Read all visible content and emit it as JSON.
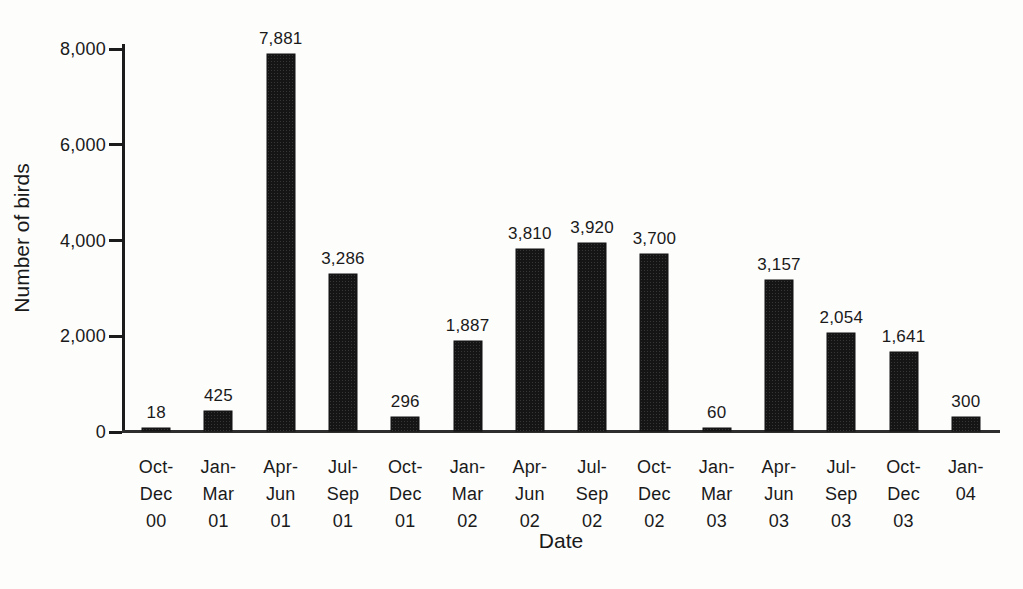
{
  "chart_data": {
    "type": "bar",
    "title": "",
    "xlabel": "Date",
    "ylabel": "Number of birds",
    "ylim": [
      0,
      8000
    ],
    "grid": false,
    "legend": "none",
    "bar_color": "#151515",
    "y_ticks": [
      {
        "value": 0,
        "label": "0"
      },
      {
        "value": 2000,
        "label": "2,000"
      },
      {
        "value": 4000,
        "label": "4,000"
      },
      {
        "value": 6000,
        "label": "6,000"
      },
      {
        "value": 8000,
        "label": "8,000"
      }
    ],
    "categories": [
      "Oct-Dec 00",
      "Jan-Mar 01",
      "Apr-Jun 01",
      "Jul-Sep 01",
      "Oct-Dec 01",
      "Jan-Mar 02",
      "Apr-Jun 02",
      "Jul-Sep 02",
      "Oct-Dec 02",
      "Jan-Mar 03",
      "Apr-Jun 03",
      "Jul-Sep 03",
      "Oct-Dec 03",
      "Jan-04"
    ],
    "category_lines": [
      [
        "Oct-",
        "Dec",
        "00"
      ],
      [
        "Jan-",
        "Mar",
        "01"
      ],
      [
        "Apr-",
        "Jun",
        "01"
      ],
      [
        "Jul-",
        "Sep",
        "01"
      ],
      [
        "Oct-",
        "Dec",
        "01"
      ],
      [
        "Jan-",
        "Mar",
        "02"
      ],
      [
        "Apr-",
        "Jun",
        "02"
      ],
      [
        "Jul-",
        "Sep",
        "02"
      ],
      [
        "Oct-",
        "Dec",
        "02"
      ],
      [
        "Jan-",
        "Mar",
        "03"
      ],
      [
        "Apr-",
        "Jun",
        "03"
      ],
      [
        "Jul-",
        "Sep",
        "03"
      ],
      [
        "Oct-",
        "Dec",
        "03"
      ],
      [
        "Jan-",
        "04"
      ]
    ],
    "values": [
      18,
      425,
      7881,
      3286,
      296,
      1887,
      3810,
      3920,
      3700,
      60,
      3157,
      2054,
      1641,
      300
    ],
    "value_labels": [
      "18",
      "425",
      "7,881",
      "3,286",
      "296",
      "1,887",
      "3,810",
      "3,920",
      "3,700",
      "60",
      "3,157",
      "2,054",
      "1,641",
      "300"
    ]
  }
}
